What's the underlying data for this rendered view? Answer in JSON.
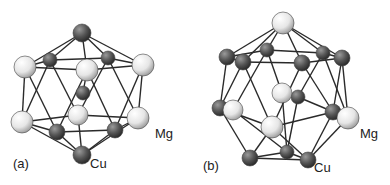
{
  "figure": {
    "panels": [
      {
        "id": "a",
        "label": "(a)",
        "label_pos": [
          13,
          168
        ],
        "element_labels": [
          {
            "text": "Mg",
            "pos": [
              155,
              138
            ]
          },
          {
            "text": "Cu",
            "pos": [
              90,
              168
            ]
          }
        ],
        "atoms": [
          {
            "el": "Cu",
            "x": 82,
            "y": 33,
            "r": 9
          },
          {
            "el": "Cu",
            "x": 50,
            "y": 60,
            "r": 7
          },
          {
            "el": "Cu",
            "x": 108,
            "y": 58,
            "r": 7
          },
          {
            "el": "Mg",
            "x": 25,
            "y": 67,
            "r": 11
          },
          {
            "el": "Mg",
            "x": 143,
            "y": 65,
            "r": 11
          },
          {
            "el": "Cu",
            "x": 83,
            "y": 93,
            "r": 7
          },
          {
            "el": "Mg",
            "x": 78,
            "y": 115,
            "r": 10
          },
          {
            "el": "Mg",
            "x": 87,
            "y": 70,
            "r": 11
          },
          {
            "el": "Mg",
            "x": 22,
            "y": 122,
            "r": 11
          },
          {
            "el": "Mg",
            "x": 138,
            "y": 118,
            "r": 11
          },
          {
            "el": "Cu",
            "x": 57,
            "y": 132,
            "r": 8
          },
          {
            "el": "Cu",
            "x": 115,
            "y": 130,
            "r": 8
          },
          {
            "el": "Cu",
            "x": 82,
            "y": 155,
            "r": 9
          }
        ],
        "bonds": [
          [
            0,
            1
          ],
          [
            0,
            2
          ],
          [
            0,
            3
          ],
          [
            0,
            4
          ],
          [
            0,
            7
          ],
          [
            1,
            2
          ],
          [
            1,
            3
          ],
          [
            2,
            4
          ],
          [
            3,
            7
          ],
          [
            7,
            4
          ],
          [
            3,
            8
          ],
          [
            4,
            9
          ],
          [
            3,
            10
          ],
          [
            7,
            10
          ],
          [
            7,
            11
          ],
          [
            4,
            11
          ],
          [
            1,
            6
          ],
          [
            2,
            6
          ],
          [
            1,
            8
          ],
          [
            2,
            9
          ],
          [
            8,
            10
          ],
          [
            10,
            11
          ],
          [
            11,
            9
          ],
          [
            8,
            6
          ],
          [
            9,
            6
          ],
          [
            8,
            12
          ],
          [
            10,
            12
          ],
          [
            11,
            12
          ],
          [
            9,
            12
          ],
          [
            6,
            12
          ],
          [
            5,
            7
          ]
        ]
      },
      {
        "id": "b",
        "label": "(b)",
        "label_pos": [
          203,
          170
        ],
        "element_labels": [
          {
            "text": "Mg",
            "pos": [
              360,
              138
            ]
          },
          {
            "text": "Cu",
            "pos": [
              314,
              172
            ]
          }
        ],
        "atoms": [
          {
            "el": "Mg",
            "x": 283,
            "y": 23,
            "r": 11
          },
          {
            "el": "Cu",
            "x": 267,
            "y": 50,
            "r": 7
          },
          {
            "el": "Cu",
            "x": 323,
            "y": 53,
            "r": 7
          },
          {
            "el": "Mg",
            "x": 282,
            "y": 93,
            "r": 10
          },
          {
            "el": "Cu",
            "x": 298,
            "y": 97,
            "r": 7
          },
          {
            "el": "Mg",
            "x": 233,
            "y": 110,
            "r": 10
          },
          {
            "el": "Cu",
            "x": 287,
            "y": 152,
            "r": 7
          },
          {
            "el": "Cu",
            "x": 227,
            "y": 57,
            "r": 8
          },
          {
            "el": "Cu",
            "x": 243,
            "y": 62,
            "r": 8
          },
          {
            "el": "Cu",
            "x": 302,
            "y": 63,
            "r": 8
          },
          {
            "el": "Cu",
            "x": 342,
            "y": 58,
            "r": 8
          },
          {
            "el": "Cu",
            "x": 220,
            "y": 108,
            "r": 8
          },
          {
            "el": "Mg",
            "x": 348,
            "y": 118,
            "r": 11
          },
          {
            "el": "Cu",
            "x": 333,
            "y": 112,
            "r": 8
          },
          {
            "el": "Mg",
            "x": 272,
            "y": 127,
            "r": 11
          },
          {
            "el": "Cu",
            "x": 250,
            "y": 158,
            "r": 8
          },
          {
            "el": "Cu",
            "x": 308,
            "y": 160,
            "r": 8
          }
        ],
        "bonds": [
          [
            0,
            7
          ],
          [
            0,
            8
          ],
          [
            0,
            1
          ],
          [
            0,
            9
          ],
          [
            0,
            2
          ],
          [
            0,
            10
          ],
          [
            7,
            1
          ],
          [
            1,
            2
          ],
          [
            2,
            10
          ],
          [
            7,
            8
          ],
          [
            8,
            9
          ],
          [
            9,
            10
          ],
          [
            7,
            11
          ],
          [
            8,
            11
          ],
          [
            8,
            14
          ],
          [
            9,
            14
          ],
          [
            9,
            13
          ],
          [
            10,
            13
          ],
          [
            10,
            12
          ],
          [
            1,
            3
          ],
          [
            2,
            4
          ],
          [
            1,
            5
          ],
          [
            2,
            12
          ],
          [
            11,
            14
          ],
          [
            14,
            13
          ],
          [
            11,
            15
          ],
          [
            14,
            15
          ],
          [
            14,
            16
          ],
          [
            13,
            16
          ],
          [
            12,
            16
          ],
          [
            15,
            16
          ],
          [
            15,
            6
          ],
          [
            6,
            16
          ],
          [
            5,
            6
          ],
          [
            3,
            6
          ],
          [
            4,
            6
          ],
          [
            11,
            5
          ],
          [
            13,
            12
          ],
          [
            4,
            12
          ]
        ]
      }
    ],
    "colors": {
      "Mg_light": "#f4f4f4",
      "Mg_dark": "#9a9a9a",
      "Cu_light": "#8a8a8a",
      "Cu_dark": "#2e2e2e",
      "bond": "#2a2a2a"
    }
  }
}
